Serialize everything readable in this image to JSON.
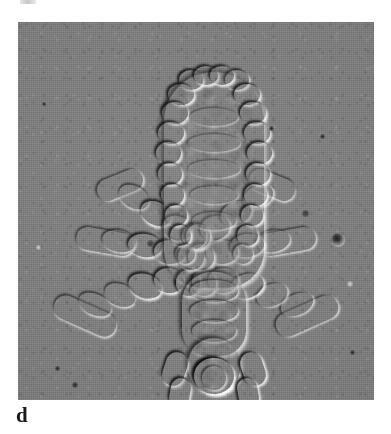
{
  "figure": {
    "panel_label": "d",
    "specimen": "head louse (Pediculus humanus capitis), ventral view",
    "imaging_mode": "differential interference contrast micrograph",
    "orientation": "head at bottom, abdomen at top",
    "background_color": "#7d7d7d",
    "label_color": "#1a1a1a",
    "plate": {
      "x": 18,
      "y": 22,
      "width": 356,
      "height": 378
    }
  },
  "anatomy": {
    "abdomen": {
      "name": "abdomen",
      "segment_pairs": 9,
      "center_x": 196,
      "top_y": 48,
      "bottom_y": 268,
      "max_width": 104
    },
    "thorax": {
      "name": "thorax",
      "center_x": 196,
      "top_y": 268,
      "bottom_y": 330
    },
    "head": {
      "name": "head",
      "center_x": 196,
      "top_y": 330,
      "bottom_y": 382
    },
    "antennae": {
      "name": "antennae",
      "count": 2
    },
    "legs": {
      "name": "legs",
      "pairs": 3,
      "pair_labels": [
        "foreleg-pair",
        "midleg-pair",
        "hindleg-pair"
      ],
      "segments_per_leg": 5
    }
  },
  "debris": [
    {
      "name": "debris-particle-large",
      "x": 337,
      "y": 240,
      "size": 13,
      "kind": "ring"
    },
    {
      "name": "debris-speck-1",
      "x": 150,
      "y": 243,
      "size": 6,
      "kind": "speck"
    },
    {
      "name": "debris-speck-2",
      "x": 305,
      "y": 213,
      "size": 6,
      "kind": "speck"
    },
    {
      "name": "debris-speck-3",
      "x": 75,
      "y": 385,
      "size": 5,
      "kind": "speck"
    },
    {
      "name": "debris-speck-4",
      "x": 57,
      "y": 368,
      "size": 4,
      "kind": "speck"
    },
    {
      "name": "debris-speck-5",
      "x": 322,
      "y": 136,
      "size": 4,
      "kind": "speck"
    },
    {
      "name": "debris-speck-6",
      "x": 271,
      "y": 128,
      "size": 4,
      "kind": "speck"
    },
    {
      "name": "debris-speck-7",
      "x": 352,
      "y": 352,
      "size": 4,
      "kind": "speck"
    },
    {
      "name": "debris-speck-8",
      "x": 44,
      "y": 104,
      "size": 3,
      "kind": "speck"
    },
    {
      "name": "debris-highlight-1",
      "x": 349,
      "y": 283,
      "size": 5,
      "kind": "light"
    },
    {
      "name": "debris-highlight-2",
      "x": 38,
      "y": 247,
      "size": 4,
      "kind": "light"
    }
  ]
}
